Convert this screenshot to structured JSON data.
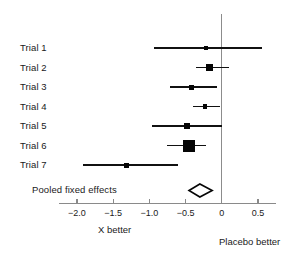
{
  "chart_data": {
    "type": "forest",
    "title": "",
    "xlabel": "",
    "ylabel": "",
    "xlim": [
      -2.25,
      0.75
    ],
    "xticks": [
      -2.0,
      -1.5,
      -1.0,
      -0.5,
      0,
      0.5
    ],
    "xtick_labels": [
      "−2.0",
      "−1.5",
      "−1.0",
      "−0.5",
      "0",
      "0.5"
    ],
    "grid": false,
    "reference_line": 0,
    "left_caption": "X better",
    "right_caption": "Placebo better",
    "summary_label": "Pooled fixed effects",
    "studies": [
      {
        "label": "Trial 1",
        "estimate": -0.22,
        "ci_low": -0.93,
        "ci_high": 0.55,
        "weight_size": 4
      },
      {
        "label": "Trial 2",
        "estimate": -0.17,
        "ci_low": -0.36,
        "ci_high": 0.1,
        "weight_size": 7
      },
      {
        "label": "Trial 3",
        "estimate": -0.42,
        "ci_low": -0.71,
        "ci_high": -0.07,
        "weight_size": 5
      },
      {
        "label": "Trial 4",
        "estimate": -0.23,
        "ci_low": -0.4,
        "ci_high": -0.02,
        "weight_size": 4.5
      },
      {
        "label": "Trial 5",
        "estimate": -0.48,
        "ci_low": -0.96,
        "ci_high": 0.0,
        "weight_size": 6
      },
      {
        "label": "Trial 6",
        "estimate": -0.45,
        "ci_low": -0.76,
        "ci_high": -0.22,
        "weight_size": 12
      },
      {
        "label": "Trial 7",
        "estimate": -1.31,
        "ci_low": -1.92,
        "ci_high": -0.6,
        "weight_size": 5
      }
    ],
    "summary": {
      "estimate": -0.3,
      "ci_low": -0.45,
      "ci_high": -0.13
    }
  },
  "layout": {
    "plot_left_px": 77,
    "plot_right_px": 258,
    "x_min_value": -2.0,
    "x_max_value": 0.5,
    "row_start_y": 48,
    "row_step_y": 19.5,
    "axis_y": 203,
    "summary_y": 190,
    "label_x": 20,
    "zero_line_top": 14,
    "zero_line_bottom": 203
  },
  "colors": {
    "marker": "#050505",
    "line": "#111111",
    "axis": "#8a8a8a",
    "reference": "#8c8c8c",
    "text": "#1a1a1a",
    "background": "#ffffff"
  }
}
